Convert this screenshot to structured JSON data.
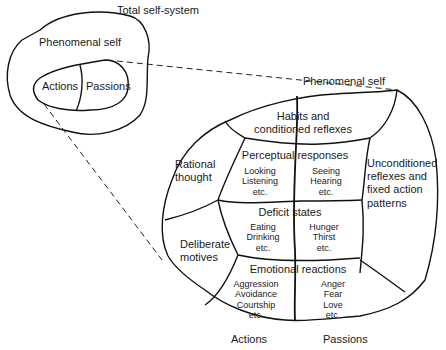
{
  "small_diagram": {
    "title": "Total self-system",
    "phenomenal_self": "Phenomenal self",
    "actions": "Actions",
    "passions": "Passions"
  },
  "large_diagram": {
    "title": "Phenomenal self",
    "habits": {
      "line1": "Habits and",
      "line2": "conditioned reflexes"
    },
    "rational": {
      "line1": "Rational",
      "line2": "thought"
    },
    "deliberate": {
      "line1": "Deliberate",
      "line2": "motives"
    },
    "unconditioned": {
      "line1": "Unconditioned",
      "line2": "reflexes and",
      "line3": "fixed action",
      "line4": "patterns"
    },
    "perceptual": {
      "title": "Perceptual responses",
      "left": [
        "Looking",
        "Listening",
        "etc."
      ],
      "right": [
        "Seeing",
        "Hearing",
        "etc."
      ]
    },
    "deficit": {
      "title": "Deficit states",
      "left": [
        "Eating",
        "Drinking",
        "etc."
      ],
      "right": [
        "Hunger",
        "Thirst",
        "etc."
      ]
    },
    "emotional": {
      "title": "Emotional reactions",
      "left": [
        "Aggression",
        "Avoidance",
        "Courtship",
        "etc."
      ],
      "right": [
        "Anger",
        "Fear",
        "Love",
        "etc."
      ]
    },
    "bottom_left": "Actions",
    "bottom_right": "Passions"
  }
}
